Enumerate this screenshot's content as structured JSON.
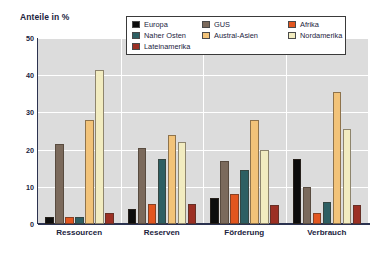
{
  "chart": {
    "title": "Anteile in %",
    "ylabel_inline": "Anteile in %"
  },
  "legend": {
    "items": [
      {
        "label": "Europa",
        "color": "#0d0d0d"
      },
      {
        "label": "GUS",
        "color": "#7b6a5c"
      },
      {
        "label": "Afrika",
        "color": "#e2561f"
      },
      {
        "label": "Naher Osten",
        "color": "#2d5f63"
      },
      {
        "label": "Austral-Asien",
        "color": "#f2c379"
      },
      {
        "label": "Nordamerika",
        "color": "#f2ecc0"
      },
      {
        "label": "Lateinamerika",
        "color": "#9c3024"
      }
    ]
  },
  "chart_data": {
    "type": "bar",
    "title": "Anteile in %",
    "xlabel": "",
    "ylabel": "Anteile in %",
    "ylim": [
      0,
      50
    ],
    "yticks": [
      0,
      10,
      20,
      30,
      40,
      50
    ],
    "grid": true,
    "legend_position": "top-right",
    "categories": [
      "Ressourcen",
      "Reserven",
      "Förderung",
      "Verbrauch"
    ],
    "series": [
      {
        "name": "Europa",
        "color": "#0d0d0d",
        "values": [
          2.0,
          4.0,
          7.0,
          17.5
        ]
      },
      {
        "name": "GUS",
        "color": "#7b6a5c",
        "values": [
          21.5,
          20.5,
          17.0,
          10.0
        ]
      },
      {
        "name": "Afrika",
        "color": "#e2561f",
        "values": [
          2.0,
          5.5,
          8.0,
          3.0
        ]
      },
      {
        "name": "Naher Osten",
        "color": "#2d5f63",
        "values": [
          2.0,
          17.5,
          14.5,
          6.0
        ]
      },
      {
        "name": "Austral-Asien",
        "color": "#f2c379",
        "values": [
          28.0,
          24.0,
          28.0,
          35.5
        ]
      },
      {
        "name": "Nordamerika",
        "color": "#f2ecc0",
        "values": [
          41.5,
          22.0,
          20.0,
          25.5
        ]
      },
      {
        "name": "Lateinamerika",
        "color": "#9c3024",
        "values": [
          3.0,
          5.5,
          5.0,
          5.0
        ]
      }
    ]
  },
  "colors": {
    "plot_background": "#dcdcdc",
    "gridline": "#ffffff",
    "axis": "#2c3350",
    "text": "#1b2340",
    "page_background": "#ffffff"
  }
}
